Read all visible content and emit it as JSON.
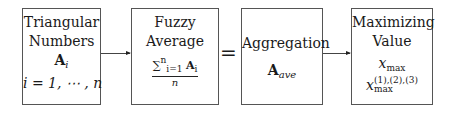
{
  "boxes": [
    {
      "title_line1": "Triangular",
      "title_line2": "Numbers",
      "symbol": "A",
      "symbol_sub": "i",
      "range": "i = 1, ⋯ , n"
    },
    {
      "title_line1": "Fuzzy",
      "title_line2": "Average",
      "formula_sum": "∑",
      "formula_lim_top": "n",
      "formula_lim_bottom": "i=1",
      "formula_symbol": "A",
      "formula_sub": "i",
      "formula_den": "n"
    },
    {
      "title": "Aggregation",
      "symbol": "A",
      "symbol_sub": "ave"
    },
    {
      "title_line1": "Maximizing",
      "title_line2": "Value",
      "var1": "x",
      "var1_sub": "max",
      "var2": "x",
      "var2_sup": "(1),(2),(3)",
      "var2_sub": "max"
    }
  ],
  "equals_sign": "=",
  "colors": {
    "border": "#555555",
    "text": "#1a1a1a",
    "arrow": "#444444"
  }
}
